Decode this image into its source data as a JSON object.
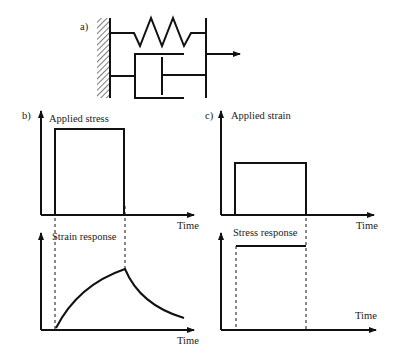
{
  "panel_a": {
    "label": "a)",
    "description": "Kelvin-Voigt model: spring and dashpot in parallel, fixed wall on left, applied force arrow on right"
  },
  "panel_b": {
    "label": "b)",
    "top_chart": {
      "ylabel": "Applied stress",
      "xlabel": "Time"
    },
    "bottom_chart": {
      "ylabel": "Strain response",
      "xlabel": "Time"
    }
  },
  "panel_c": {
    "label": "c)",
    "top_chart": {
      "ylabel": "Applied strain",
      "xlabel": "Time"
    },
    "bottom_chart": {
      "ylabel": "Stress response",
      "xlabel": "Time"
    }
  },
  "colors": {
    "ink": "#111111",
    "background": "#ffffff"
  }
}
